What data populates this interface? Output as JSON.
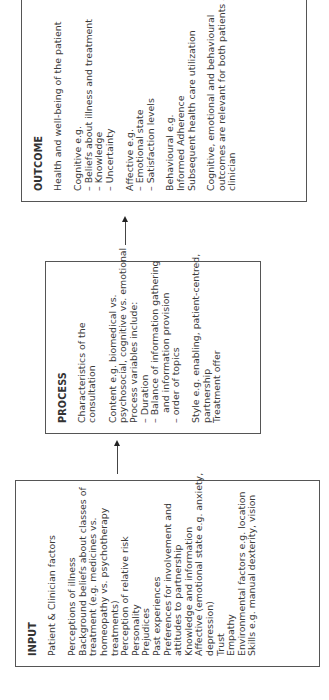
{
  "diagram": {
    "orientation": "rotated -90deg (text reads bottom-to-top)",
    "input": {
      "title": "INPUT",
      "subtitle": "Patient & Clinician factors",
      "lines": [
        "Perceptions of illness",
        "Background beliefs about  classes of",
        "treatment (e.g. medicines vs.",
        "homeopathy vs. psychotherapy",
        "treatments)",
        "Perception of relative risk",
        "Personality",
        "Prejudices",
        "Past experiences",
        "Preferences for involvement and",
        "attitudes to partnership",
        "Knowledge and information",
        "Affective (emotional state e.g. anxiety,",
        "depression)",
        "Trust",
        "Empathy",
        "Environmental factors e.g. location",
        "Skills e.g. manual dexterity, vision"
      ]
    },
    "process": {
      "title": "PROCESS",
      "subtitle": "Characteristics of the consultation",
      "content": [
        "Content e.g. biomedical vs.",
        "psychosocial, cognitive vs. emotional",
        "Process variables include:",
        "– Duration",
        "– Balance of information gathering",
        "and information provision",
        "– order of topics"
      ],
      "style": [
        "Style e.g. enabling, patient-centred,",
        "partnership",
        "Treatment offer"
      ]
    },
    "outcome": {
      "title": "OUTCOME",
      "subtitle": "Health and well-being of the patient",
      "cognitive": [
        "Cognitive e.g.",
        "– Beliefs about illness and treatment",
        "– Knowledge",
        "– Uncertainty"
      ],
      "affective": [
        "Affective e.g.",
        "– Emotional state",
        "– Satisfaction levels"
      ],
      "behavioural": [
        "Behavioural e.g.",
        "Informed Adherence",
        "Subsequent health care utilization"
      ],
      "note": [
        "Cognitive, emotional and behavioural",
        "outcomes are relevant for both patients and",
        "clinician"
      ]
    },
    "arrows": [
      {
        "from": "INPUT",
        "to": "PROCESS"
      },
      {
        "from": "PROCESS",
        "to": "OUTCOME"
      }
    ],
    "colors": {
      "border": "#555555",
      "text": "#3a3a3a",
      "arrow": "#444444",
      "background": "#ffffff"
    }
  }
}
